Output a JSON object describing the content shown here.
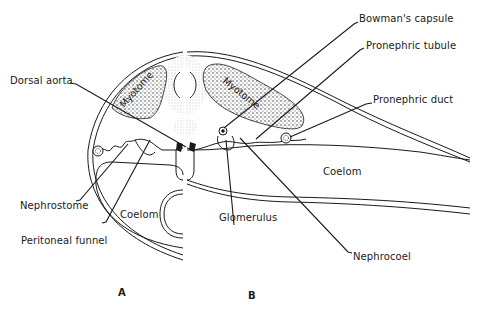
{
  "figure": {
    "type": "diagram",
    "panels": [
      {
        "id": "A",
        "label": "A"
      },
      {
        "id": "B",
        "label": "B"
      }
    ],
    "labels": {
      "dorsal_aorta": "Dorsal aorta",
      "bowmans_capsule": "Bowman's capsule",
      "pronephric_tubule": "Pronephric tubule",
      "pronephric_duct": "Pronephric duct",
      "coelom_b": "Coelom",
      "nephrostome": "Nephrostome",
      "coelom_a": "Coelom",
      "peritoneal_funnel": "Peritoneal funnel",
      "glomerulus": "Glomerulus",
      "nephrocoel": "Nephrocoel",
      "myotome_left": "Myotome",
      "myotome_right": "Myotome"
    },
    "colors": {
      "ink": "#1a1a1a",
      "stipple": "#6b6b6b",
      "background": "#ffffff"
    }
  }
}
